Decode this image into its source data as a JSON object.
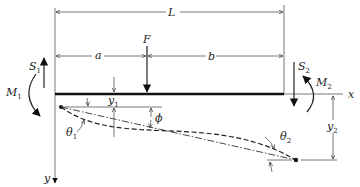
{
  "diagram": {
    "type": "beam-deflection",
    "labels": {
      "L": "L",
      "a": "a",
      "b": "b",
      "F": "F",
      "x_axis": "x",
      "y_axis": "y",
      "S1": {
        "main": "S",
        "sub": "1"
      },
      "S2": {
        "main": "S",
        "sub": "2"
      },
      "M1": {
        "main": "M",
        "sub": "1"
      },
      "M2": {
        "main": "M",
        "sub": "2"
      },
      "y1": {
        "main": "y",
        "sub": "1"
      },
      "y2": {
        "main": "y",
        "sub": "2"
      },
      "theta1": {
        "main": "θ",
        "sub": "1"
      },
      "theta2": {
        "main": "θ",
        "sub": "2"
      },
      "phi": "ϕ"
    },
    "colors": {
      "ink": "#222222",
      "thin": "#555555",
      "background": "#ffffff"
    }
  }
}
